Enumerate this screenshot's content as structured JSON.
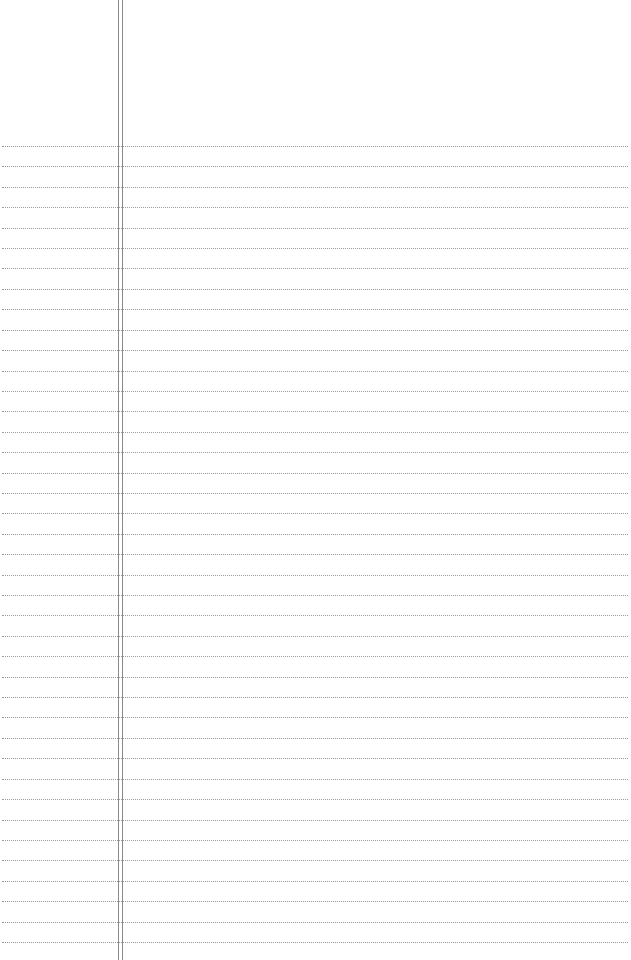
{
  "document": {
    "type": "lined-paper",
    "background_color": "#ffffff",
    "rule_color": "#9a9a9a",
    "margin_line_color": "#8a8a8a",
    "rule_style": "dotted",
    "rule_count": 40,
    "first_rule_y": 146,
    "rule_spacing": 20.41,
    "margin_lines_x": [
      118,
      122
    ]
  }
}
